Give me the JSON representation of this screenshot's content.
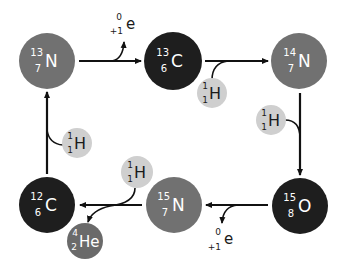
{
  "diagram": {
    "colors": {
      "nitrogen": "#717171",
      "carbon": "#1e1e1e",
      "oxygen": "#1e1e1e",
      "hydrogen": "#cfcfcf",
      "helium": "#6a6a6a",
      "arrow": "#111111",
      "text_light": "#ffffff",
      "text_dark": "#1a1a1a"
    },
    "nuclei": [
      {
        "id": "n13",
        "mass": "13",
        "atomic": "7",
        "symbol": "N"
      },
      {
        "id": "c13",
        "mass": "13",
        "atomic": "6",
        "symbol": "C"
      },
      {
        "id": "n14",
        "mass": "14",
        "atomic": "7",
        "symbol": "N"
      },
      {
        "id": "o15",
        "mass": "15",
        "atomic": "8",
        "symbol": "O"
      },
      {
        "id": "n15",
        "mass": "15",
        "atomic": "7",
        "symbol": "N"
      },
      {
        "id": "c12",
        "mass": "12",
        "atomic": "6",
        "symbol": "C"
      },
      {
        "id": "he4",
        "mass": "4",
        "atomic": "2",
        "symbol": "He"
      }
    ],
    "protons": [
      {
        "id": "h1",
        "mass": "1",
        "atomic": "1",
        "symbol": "H"
      },
      {
        "id": "h2",
        "mass": "1",
        "atomic": "1",
        "symbol": "H"
      },
      {
        "id": "h3",
        "mass": "1",
        "atomic": "1",
        "symbol": "H"
      },
      {
        "id": "h4",
        "mass": "1",
        "atomic": "1",
        "symbol": "H"
      }
    ],
    "positrons": [
      {
        "id": "e1",
        "mass": "0",
        "charge": "+1",
        "symbol": "e"
      },
      {
        "id": "e2",
        "mass": "0",
        "charge": "+1",
        "symbol": "e"
      }
    ]
  }
}
